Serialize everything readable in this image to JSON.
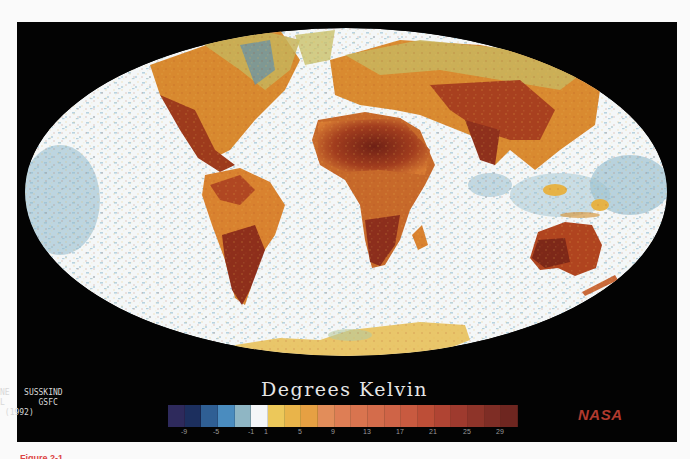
{
  "figure": {
    "credit_lines": [
      "NE   SUSSKIND",
      "L       GSFC",
      " (1992)"
    ],
    "legend": {
      "title": "Degrees Kelvin",
      "swatches": [
        "#2e2a5c",
        "#1c2f5e",
        "#2f5f94",
        "#4a8cbf",
        "#8fb6c4",
        "#f4f6f8",
        "#ecc85a",
        "#e9b44a",
        "#e6a043",
        "#e28d5a",
        "#de7e55",
        "#d9744f",
        "#d46c4b",
        "#cf6447",
        "#c85a40",
        "#bd4e37",
        "#b04433",
        "#9e3a2e",
        "#8e3429",
        "#7e2d25",
        "#6e2620"
      ],
      "tick_labels": [
        "-9",
        "-5",
        "-1",
        "1",
        "5",
        "9",
        "13",
        "17",
        "21",
        "25",
        "29"
      ]
    },
    "logo": "NASA",
    "caption_partial": "Figure 2-1",
    "colors": {
      "background_panel": "#030303",
      "ocean": "#f4f7f8",
      "cold_speckle": "#7fb0c6",
      "hot_land": "#8a2e1e",
      "warm_land": "#d2752f",
      "mild_land": "#e9b64a",
      "nasa_red": "#b03a2e"
    }
  }
}
